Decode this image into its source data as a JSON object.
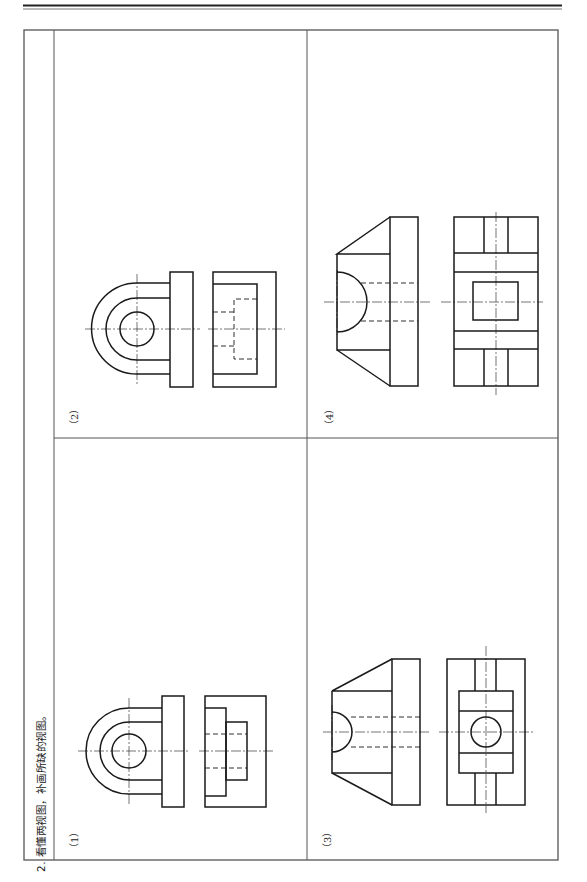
{
  "page": {
    "orientation": "rotated-90-ccw",
    "header_rule": "double-line"
  },
  "exercise": {
    "instruction": "2. 看懂两视图，补画所缺的视图。",
    "problems": [
      {
        "label": "（1）",
        "description": "Two views given: front view with U-shaped lug, circular hole and flange; side view with stepped bosses and hidden hole lines"
      },
      {
        "label": "（2）",
        "description": "Two views given: front view with U-shaped lug, circular hole and flange; side view with hidden stepped bore"
      },
      {
        "label": "（3）",
        "description": "Two views given: tapered block with semicircular groove; view with central boss and circular hole"
      },
      {
        "label": "（4）",
        "description": "Two views given: tapered block with semicircular groove; view with rectangular boss and ribs"
      }
    ]
  },
  "colors": {
    "line": "#1a1a1a",
    "table_border": "#555555",
    "background": "#ffffff"
  }
}
